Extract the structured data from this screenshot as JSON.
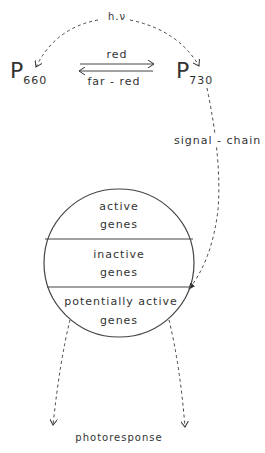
{
  "diagram": {
    "top_label": "h.ν",
    "left_state": {
      "symbol": "P",
      "subscript": "660"
    },
    "right_state": {
      "symbol": "P",
      "subscript": "730"
    },
    "forward_arrow_label": "red",
    "reverse_arrow_label": "far - red",
    "signal_label": "signal - chain",
    "cell_sections": [
      {
        "line1": "active",
        "line2": "genes"
      },
      {
        "line1": "inactive",
        "line2": "genes"
      },
      {
        "line1": "potentially active",
        "line2": "genes"
      }
    ],
    "output_label": "photoresponse"
  }
}
